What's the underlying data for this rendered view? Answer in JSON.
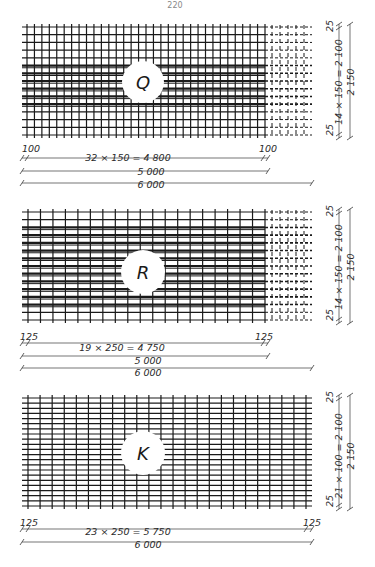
{
  "page": {
    "number_text": "220"
  },
  "panels": [
    {
      "id": "Q",
      "label": "Q",
      "top": 27,
      "bottom": 135,
      "grid": {
        "cols": 33,
        "rows": 15,
        "dashed_from_x": 265,
        "thick_rows": [
          5,
          6,
          7,
          8,
          9,
          10
        ]
      },
      "circle": {
        "cx": 143,
        "cy": 82,
        "r": 21
      },
      "dims_horizontal": {
        "edge_left": "100",
        "edge_right": "100",
        "inner": "32 × 150 = 4 800",
        "mid": "5 000",
        "total": "6 000"
      },
      "dims_vertical": {
        "top_edge": "25",
        "bottom_edge": "25",
        "inner": "14 × 150 = 2 100",
        "total": "2 150"
      }
    },
    {
      "id": "R",
      "label": "R",
      "top": 212,
      "bottom": 320,
      "grid": {
        "cols": 20,
        "rows": 15,
        "dashed_from_x": 265,
        "thick_rows": [
          2,
          3,
          4,
          5,
          6,
          7,
          8,
          9,
          10,
          11,
          12
        ]
      },
      "circle": {
        "cx": 143,
        "cy": 272,
        "r": 22
      },
      "dims_horizontal": {
        "edge_left": "125",
        "edge_right": "125",
        "inner": "19 × 250 = 4 750",
        "mid": "5 000",
        "total": "6 000"
      },
      "dims_vertical": {
        "top_edge": "25",
        "bottom_edge": "25",
        "inner": "14 × 150 = 2 100",
        "total": "2 150"
      }
    },
    {
      "id": "K",
      "label": "K",
      "top": 398,
      "bottom": 506,
      "grid": {
        "cols": 24,
        "rows": 22,
        "dashed_from_x": null,
        "thick_rows": []
      },
      "circle": {
        "cx": 143,
        "cy": 453,
        "r": 22
      },
      "dims_horizontal": {
        "edge_left": "125",
        "edge_right": "125",
        "inner": "23 × 250 = 5 750",
        "total": "6 000"
      },
      "dims_vertical": {
        "top_edge": "25",
        "bottom_edge": "25",
        "inner": "21 × 100 = 2 100",
        "total": "2 150"
      }
    }
  ],
  "colors": {
    "ink": "#1a1a1a",
    "paper": "#ffffff",
    "dim_line": "#3a3a3a"
  }
}
